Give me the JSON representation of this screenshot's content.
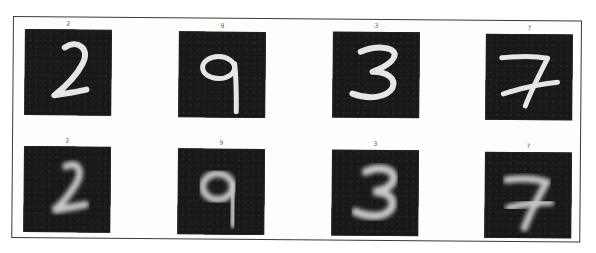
{
  "figure": {
    "rows": [
      {
        "name": "original",
        "cells": [
          {
            "title": "2",
            "digit": "2"
          },
          {
            "title": "9",
            "digit": "9"
          },
          {
            "title": "3",
            "digit": "3"
          },
          {
            "title": "7",
            "digit": "7"
          }
        ]
      },
      {
        "name": "reconstructed",
        "cells": [
          {
            "title": "2",
            "digit": "2"
          },
          {
            "title": "9",
            "digit": "9"
          },
          {
            "title": "3",
            "digit": "3"
          },
          {
            "title": "7",
            "digit": "7"
          }
        ]
      }
    ],
    "colors": {
      "tile_background": "#181818",
      "stroke_sharp": "#e6e6e6",
      "stroke_blurred": "#c8c8c8",
      "frame_border": "#3a3a3a"
    }
  }
}
